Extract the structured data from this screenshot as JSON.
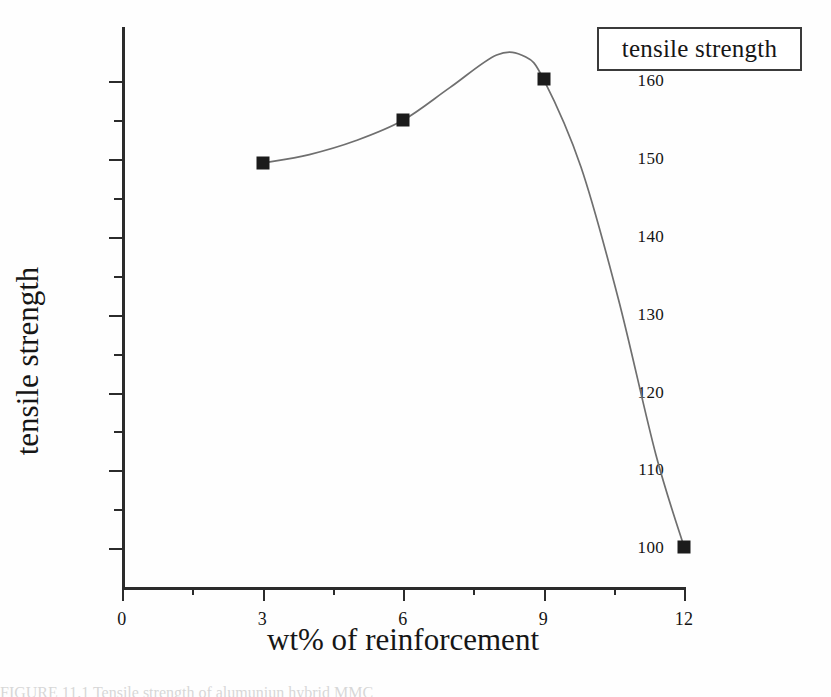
{
  "legend": {
    "entries": [
      "tensile strength"
    ]
  },
  "axes": {
    "x_title": "wt% of reinforcement",
    "y_title": "tensile strength",
    "x_ticks": [
      "0",
      "3",
      "6",
      "9",
      "12"
    ],
    "y_ticks": [
      "100",
      "110",
      "120",
      "130",
      "140",
      "150",
      "160"
    ]
  },
  "caption": {
    "text": "FIGURE 11.1    Tensile strength of alumuniun hybrid MMC"
  },
  "colors": {
    "axis": "#2b2b2b",
    "marker": "#1b1b1b",
    "curve": "#6f6f6f",
    "background": "#fefefe"
  },
  "chart_data": {
    "type": "line",
    "title": "",
    "xlabel": "wt% of reinforcement",
    "ylabel": "tensile strength",
    "xlim": [
      0,
      12
    ],
    "ylim": [
      95,
      167
    ],
    "xticks": [
      0,
      3,
      6,
      9,
      12
    ],
    "yticks": [
      100,
      110,
      120,
      130,
      140,
      150,
      160
    ],
    "grid": false,
    "legend_position": "top-right",
    "series": [
      {
        "name": "tensile strength",
        "marker": "filled-square",
        "x": [
          3,
          6,
          9,
          12
        ],
        "values": [
          149.5,
          155.0,
          160.3,
          100.2
        ]
      }
    ],
    "curve_note": "smoothed spline through points, peaks at approximately (8, 163.5) then drops steeply to (12, 100)"
  }
}
